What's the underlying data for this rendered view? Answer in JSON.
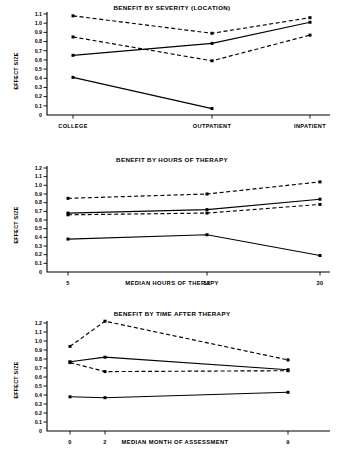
{
  "figure": {
    "ylabel": "EFFECT SIZE",
    "panel_count": 3
  },
  "chart_data": [
    {
      "type": "line",
      "title": "BENEFIT BY SEVERITY (LOCATION)",
      "xlabel": "",
      "ylabel": "EFFECT SIZE",
      "categories": [
        "COLLEGE",
        "OUTPATIENT",
        "INPATIENT"
      ],
      "ytick_labels": [
        "1.1",
        "1.0",
        "0.9",
        "0.8",
        "0.7",
        "0.6",
        "0.5",
        "0.4",
        "0.3",
        "0.2",
        "0.1",
        "0"
      ],
      "ylim": [
        0,
        1.1
      ],
      "grid": false,
      "legend": "none",
      "series": [
        {
          "name": "series-1-dashed-upper",
          "style": "dashed",
          "x": [
            "COLLEGE",
            "OUTPATIENT",
            "INPATIENT"
          ],
          "values": [
            1.08,
            0.89,
            1.06
          ]
        },
        {
          "name": "series-2-dashed-lower",
          "style": "dashed",
          "x": [
            "COLLEGE",
            "OUTPATIENT",
            "INPATIENT"
          ],
          "values": [
            0.85,
            0.59,
            0.87
          ]
        },
        {
          "name": "series-3-solid-upper",
          "style": "solid",
          "x": [
            "COLLEGE",
            "OUTPATIENT",
            "INPATIENT"
          ],
          "values": [
            0.65,
            0.78,
            1.01
          ]
        },
        {
          "name": "series-4-solid-lower",
          "style": "solid",
          "x": [
            "COLLEGE",
            "OUTPATIENT"
          ],
          "values": [
            0.41,
            0.07
          ]
        }
      ]
    },
    {
      "type": "line",
      "title": "BENEFIT BY HOURS OF THERAPY",
      "xlabel": "MEDIAN HOURS OF THERAPY",
      "ylabel": "EFFECT SIZE",
      "categories": [
        "5",
        "12",
        "30"
      ],
      "ytick_labels": [
        "1.2",
        "1.1",
        "1.0",
        "0.9",
        "0.8",
        "0.7",
        "0.6",
        "0.5",
        "0.4",
        "0.3",
        "0.2",
        "0.1",
        "0"
      ],
      "ylim": [
        0,
        1.2
      ],
      "grid": false,
      "legend": "none",
      "series": [
        {
          "name": "series-1-dashed-upper",
          "style": "dashed",
          "x": [
            "5",
            "12",
            "30"
          ],
          "values": [
            0.85,
            0.9,
            1.04
          ]
        },
        {
          "name": "series-2-solid-upper",
          "style": "solid",
          "x": [
            "5",
            "12",
            "30"
          ],
          "values": [
            0.68,
            0.72,
            0.84
          ]
        },
        {
          "name": "series-3-dashed-lower",
          "style": "dashed",
          "x": [
            "5",
            "12",
            "30"
          ],
          "values": [
            0.66,
            0.68,
            0.78
          ]
        },
        {
          "name": "series-4-solid-lower",
          "style": "solid",
          "x": [
            "5",
            "12",
            "30"
          ],
          "values": [
            0.38,
            0.43,
            0.19
          ]
        }
      ]
    },
    {
      "type": "line",
      "title": "BENEFIT BY TIME AFTER THERAPY",
      "xlabel": "MEDIAN MONTH OF ASSESSMENT",
      "ylabel": "EFFECT SIZE",
      "categories": [
        "0",
        "2",
        "9"
      ],
      "ytick_labels": [
        "1.2",
        "1.1",
        "1.0",
        "0.9",
        "0.8",
        "0.7",
        "0.6",
        "0.5",
        "0.4",
        "0.3",
        "0.2",
        "0.1",
        "0"
      ],
      "ylim": [
        0,
        1.2
      ],
      "grid": false,
      "legend": "none",
      "series": [
        {
          "name": "series-1-dashed-upper",
          "style": "dashed",
          "x": [
            "0",
            "2",
            "9"
          ],
          "values": [
            0.94,
            1.22,
            0.79
          ]
        },
        {
          "name": "series-2-solid-upper",
          "style": "solid",
          "x": [
            "0",
            "2",
            "9"
          ],
          "values": [
            0.77,
            0.82,
            0.68
          ]
        },
        {
          "name": "series-3-dashed-lower",
          "style": "dashed",
          "x": [
            "0",
            "2",
            "9"
          ],
          "values": [
            0.76,
            0.66,
            0.67
          ]
        },
        {
          "name": "series-4-solid-lower",
          "style": "solid",
          "x": [
            "0",
            "2",
            "9"
          ],
          "values": [
            0.38,
            0.37,
            0.43
          ]
        }
      ]
    }
  ]
}
